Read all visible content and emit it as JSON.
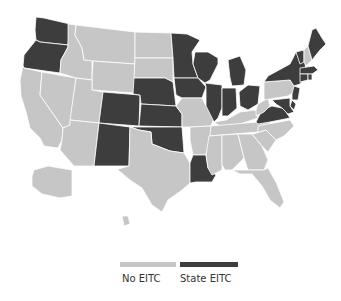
{
  "colors": {
    "no_eitc": "#c6c6c6",
    "state_eitc": "#3d3d3d",
    "border": "#ffffff"
  },
  "legend": {
    "items": [
      {
        "label": "No EITC",
        "color": "#c6c6c6"
      },
      {
        "label": "State EITC",
        "color": "#3d3d3d"
      }
    ]
  },
  "map": {
    "states_with_eitc": [
      "WA",
      "OR",
      "CO",
      "NE",
      "KS",
      "NM",
      "OK",
      "MN",
      "IA",
      "WI",
      "IL",
      "MI",
      "IN",
      "OH",
      "LA",
      "VA",
      "MD",
      "DE",
      "NJ",
      "NY",
      "VT",
      "MA",
      "RI",
      "CT",
      "ME",
      "DC"
    ],
    "states_without_eitc": [
      "ID",
      "MT",
      "WY",
      "NV",
      "CA",
      "UT",
      "AZ",
      "ND",
      "SD",
      "TX",
      "MO",
      "AR",
      "MS",
      "AL",
      "GA",
      "FL",
      "SC",
      "NC",
      "TN",
      "KY",
      "WV",
      "PA",
      "NH",
      "AK",
      "HI"
    ]
  }
}
